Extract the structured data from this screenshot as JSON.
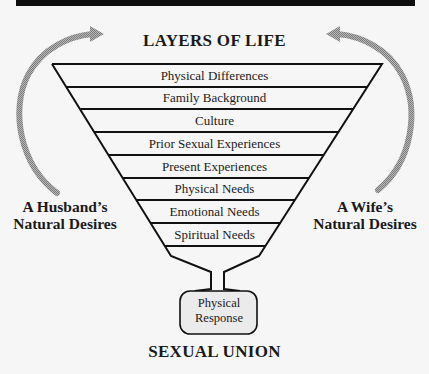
{
  "diagram": {
    "header_bar_color": "#0e0e0e",
    "title_top": "LAYERS OF LIFE",
    "title_bottom": "SEXUAL UNION",
    "layers": [
      {
        "label": "Physical Differences"
      },
      {
        "label": "Family Background"
      },
      {
        "label": "Culture"
      },
      {
        "label": "Prior Sexual Experiences"
      },
      {
        "label": "Present Experiences"
      },
      {
        "label": "Physical Needs"
      },
      {
        "label": "Emotional Needs"
      },
      {
        "label": "Spiritual Needs"
      }
    ],
    "left_label": {
      "line1": "A Husband’s",
      "line2": "Natural Desires"
    },
    "right_label": {
      "line1": "A Wife’s",
      "line2": "Natural Desires"
    },
    "output_box": {
      "line1": "Physical",
      "line2": "Response",
      "fill": "#ebebeb"
    },
    "arrows": [
      {
        "name": "husband-desires-arrow",
        "direction": "up-and-right-into-funnel",
        "color": "#9a9a9a"
      },
      {
        "name": "wife-desires-arrow",
        "direction": "up-and-left-into-funnel",
        "color": "#9a9a9a"
      }
    ]
  }
}
